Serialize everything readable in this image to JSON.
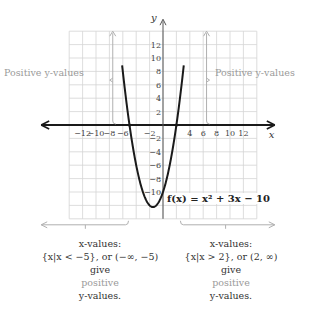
{
  "chart_data": {
    "type": "line",
    "title": "",
    "function_label": "f(x) = x² + 3x − 10",
    "xlabel": "x",
    "ylabel": "y",
    "xlim": [
      -14,
      14
    ],
    "ylim": [
      -14,
      14
    ],
    "grid": true,
    "x_ticks": [
      -12,
      -10,
      -8,
      -6,
      -2,
      4,
      6,
      8,
      10,
      12
    ],
    "y_ticks": [
      12,
      10,
      8,
      6,
      4,
      2,
      -2,
      -4,
      -6,
      -8,
      -10
    ],
    "roots": [
      -5,
      2
    ],
    "vertex": [
      -1.5,
      -12.25
    ],
    "series": [
      {
        "name": "f(x) = x^2 + 3x - 10",
        "coefficients": {
          "a": 1,
          "b": 3,
          "c": -10
        }
      }
    ],
    "annotations": [
      "Positive y-values",
      "Positive y-values",
      "x-values: {x|x < −5}, or (−∞, −5) give positive y-values.",
      "x-values: {x|x > 2}, or (2, ∞) give positive y-values."
    ]
  },
  "labels": {
    "left_positive": "Positive y-values",
    "right_positive": "Positive y-values",
    "function": "f(x) = x² + 3x − 10"
  },
  "captions": {
    "left": {
      "line1": "x-values:",
      "line2": "{x|x < −5}, or (−∞, −5)",
      "line3": "give",
      "line4": "positive",
      "line5": "y-values."
    },
    "right": {
      "line1": "x-values:",
      "line2": "{x|x > 2}, or (2, ∞)",
      "line3": "give",
      "line4": "positive",
      "line5": "y-values."
    }
  }
}
